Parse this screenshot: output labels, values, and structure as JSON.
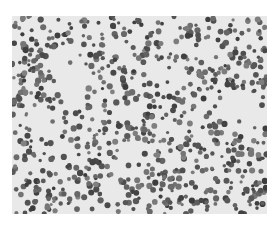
{
  "image": {
    "description": "Grayscale microscopy image of a dense blood smear with many small round dark cells on a light gray background",
    "background_color": "#e9e9e9",
    "cell_color_dark": "#4a4a4a",
    "cell_color_mid": "#7a7a7a",
    "cell_count_estimate": 900
  }
}
